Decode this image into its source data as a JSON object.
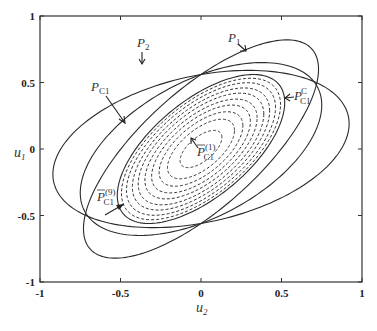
{
  "figure": {
    "xlabel": "u",
    "xlabel_sub": "2",
    "ylabel": "u",
    "ylabel_sub": "1",
    "xlim": [
      -1,
      1
    ],
    "ylim": [
      -1,
      1
    ],
    "xticks": [
      -1,
      -0.5,
      0,
      0.5,
      1
    ],
    "yticks": [
      -1,
      -0.5,
      0,
      0.5,
      1
    ],
    "xtick_labels": [
      "-1",
      "-0.5",
      "0",
      "0.5",
      "1"
    ],
    "ytick_labels": [
      "-1",
      "-0.5",
      "0",
      "0.5",
      "1"
    ]
  },
  "curves": [
    {
      "id": "P1",
      "style": "solid",
      "ellipse": {
        "p": 0.73,
        "q": 0.0,
        "r": 0.6,
        "s": 0.56
      }
    },
    {
      "id": "P2",
      "style": "solid",
      "ellipse": {
        "p": 0.92,
        "q": 0.0,
        "r": 0.19,
        "s": 0.56
      }
    },
    {
      "id": "PC1",
      "style": "solid",
      "ellipse": {
        "p": 0.75,
        "q": 0.0,
        "r": 0.33,
        "s": 0.56
      }
    },
    {
      "id": "PCC",
      "style": "solid",
      "ellipse": {
        "p": 0.52,
        "q": 0.0,
        "r": 0.35,
        "s": 0.437
      }
    }
  ],
  "dashed_family": {
    "base": "PCC",
    "count": 9,
    "scales": [
      0.25,
      0.4,
      0.5,
      0.59,
      0.67,
      0.75,
      0.82,
      0.89,
      0.95
    ]
  },
  "labels": {
    "P1": {
      "main": "P",
      "sub": "1",
      "sup": ""
    },
    "P2": {
      "main": "P",
      "sub": "2",
      "sup": ""
    },
    "PC1": {
      "main": "P",
      "sub": "C1",
      "sup": ""
    },
    "PCC": {
      "main": "P",
      "sub": "C1",
      "sup": "C"
    },
    "PC1_1": {
      "main": "P",
      "sub": "C1",
      "sup": "(1)",
      "overbar": true
    },
    "PC1_9": {
      "main": "P",
      "sub": "C1",
      "sup": "(9)",
      "overbar": true
    }
  }
}
